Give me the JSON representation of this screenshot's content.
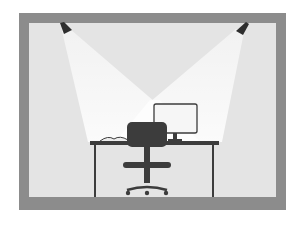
{
  "illustration": {
    "subject": "office desk lit by two ceiling spotlights",
    "colors": {
      "background": "#ffffff",
      "frame": "#8c8c8c",
      "wall": "#e6e6e6",
      "light_beam": "#fafafa",
      "furniture": "#3c3c3c",
      "monitor_screen": "#f4f4f4"
    },
    "elements": [
      "room-frame",
      "left-spotlight",
      "right-spotlight",
      "desk",
      "monitor",
      "open-book",
      "office-chair"
    ]
  }
}
